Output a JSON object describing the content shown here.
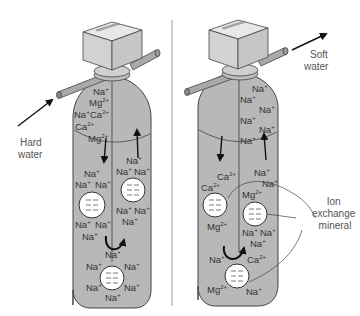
{
  "colors": {
    "tank_fill": "#b8b8b8",
    "tank_stroke": "#444444",
    "valve_fill": "#d9d9d9",
    "pipe_fill": "#a9a9a9",
    "bead_fill": "#ffffff",
    "divider": "#999999",
    "text": "#333333",
    "label_text": "#555555",
    "arrow": "#111111"
  },
  "labels": {
    "hard_water": [
      "Hard",
      "water"
    ],
    "soft_water": [
      "Soft",
      "water"
    ],
    "ion_exchange_mineral": [
      "Ion",
      "exchange",
      "mineral"
    ]
  },
  "left_tank": {
    "name": "hard-water-tank",
    "ions": [
      {
        "base": "Na",
        "charge": "+",
        "x": 93,
        "y": 95
      },
      {
        "base": "Mg",
        "charge": "2+",
        "x": 89,
        "y": 106
      },
      {
        "base": "Na",
        "charge": "+",
        "x": 74,
        "y": 118
      },
      {
        "base": "Ca",
        "charge": "2+",
        "x": 90,
        "y": 118
      },
      {
        "base": "Ca",
        "charge": "2+",
        "x": 75,
        "y": 130
      },
      {
        "base": "Mg",
        "charge": "2+",
        "x": 88,
        "y": 142
      },
      {
        "base": "Na",
        "charge": "+",
        "x": 84,
        "y": 177
      },
      {
        "base": "Na",
        "charge": "+",
        "x": 75,
        "y": 188
      },
      {
        "base": "Na",
        "charge": "+",
        "x": 95,
        "y": 188
      },
      {
        "base": "Na",
        "charge": "+",
        "x": 126,
        "y": 164
      },
      {
        "base": "Na",
        "charge": "+",
        "x": 116,
        "y": 175
      },
      {
        "base": "Na",
        "charge": "+",
        "x": 134,
        "y": 175
      },
      {
        "base": "Na",
        "charge": "+",
        "x": 116,
        "y": 214
      },
      {
        "base": "Na",
        "charge": "+",
        "x": 134,
        "y": 214
      },
      {
        "base": "Na",
        "charge": "+",
        "x": 122,
        "y": 225
      },
      {
        "base": "Na",
        "charge": "+",
        "x": 75,
        "y": 228
      },
      {
        "base": "Na",
        "charge": "+",
        "x": 95,
        "y": 228
      },
      {
        "base": "Na",
        "charge": "+",
        "x": 82,
        "y": 240
      },
      {
        "base": "Na",
        "charge": "+",
        "x": 105,
        "y": 258
      },
      {
        "base": "Na",
        "charge": "+",
        "x": 86,
        "y": 270
      },
      {
        "base": "Na",
        "charge": "+",
        "x": 124,
        "y": 270
      },
      {
        "base": "Na",
        "charge": "+",
        "x": 86,
        "y": 291
      },
      {
        "base": "Na",
        "charge": "+",
        "x": 124,
        "y": 291
      },
      {
        "base": "Na",
        "charge": "+",
        "x": 105,
        "y": 301
      }
    ],
    "beads": [
      {
        "cx": 92,
        "cy": 205,
        "r": 13
      },
      {
        "cx": 133,
        "cy": 190,
        "r": 12
      },
      {
        "cx": 112,
        "cy": 278,
        "r": 12
      }
    ]
  },
  "right_tank": {
    "name": "soft-water-tank",
    "ions": [
      {
        "base": "Na",
        "charge": "+",
        "x": 252,
        "y": 92
      },
      {
        "base": "Na",
        "charge": "+",
        "x": 240,
        "y": 103
      },
      {
        "base": "Na",
        "charge": "+",
        "x": 259,
        "y": 113
      },
      {
        "base": "Na",
        "charge": "+",
        "x": 240,
        "y": 124
      },
      {
        "base": "Na",
        "charge": "+",
        "x": 259,
        "y": 133
      },
      {
        "base": "Na",
        "charge": "+",
        "x": 240,
        "y": 144
      },
      {
        "base": "Ca",
        "charge": "2+",
        "x": 217,
        "y": 180
      },
      {
        "base": "Ca",
        "charge": "2+",
        "x": 201,
        "y": 191
      },
      {
        "base": "Mg",
        "charge": "2+",
        "x": 207,
        "y": 230
      },
      {
        "base": "Na",
        "charge": "+",
        "x": 254,
        "y": 176
      },
      {
        "base": "Na",
        "charge": "+",
        "x": 262,
        "y": 187
      },
      {
        "base": "Mg",
        "charge": "2+",
        "x": 242,
        "y": 198
      },
      {
        "base": "Na",
        "charge": "+",
        "x": 242,
        "y": 236
      },
      {
        "base": "Na",
        "charge": "+",
        "x": 260,
        "y": 236
      },
      {
        "base": "Na",
        "charge": "+",
        "x": 250,
        "y": 247
      },
      {
        "base": "Na",
        "charge": "+",
        "x": 209,
        "y": 263
      },
      {
        "base": "Ca",
        "charge": "2+",
        "x": 247,
        "y": 263
      },
      {
        "base": "Mg",
        "charge": "2+",
        "x": 207,
        "y": 293
      },
      {
        "base": "Na",
        "charge": "+",
        "x": 246,
        "y": 295
      }
    ],
    "beads": [
      {
        "cx": 215,
        "cy": 205,
        "r": 12
      },
      {
        "cx": 255,
        "cy": 214,
        "r": 12
      },
      {
        "cx": 237,
        "cy": 276,
        "r": 12
      }
    ]
  }
}
